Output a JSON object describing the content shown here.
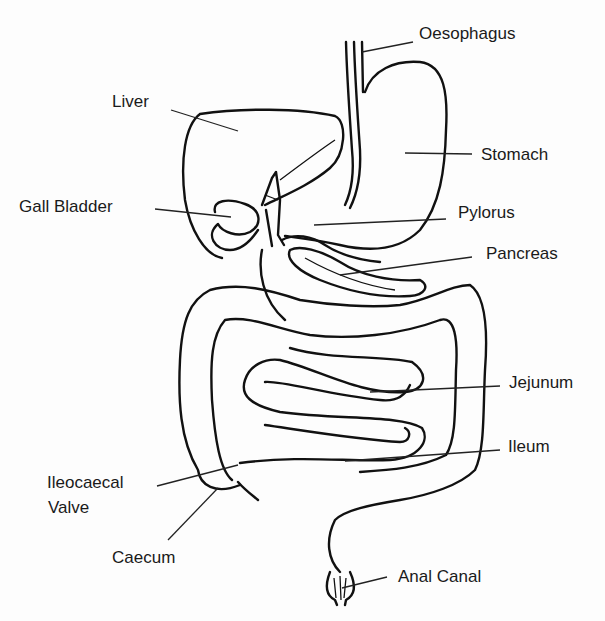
{
  "diagram": {
    "type": "anatomy",
    "labels": {
      "oesophagus": "Oesophagus",
      "liver": "Liver",
      "stomach": "Stomach",
      "gall_bladder": "Gall Bladder",
      "pylorus": "Pylorus",
      "pancreas": "Pancreas",
      "jejunum": "Jejunum",
      "ileum": "Ileum",
      "ileocaecal_valve_line1": "Ileocaecal",
      "ileocaecal_valve_line2": "Valve",
      "caecum": "Caecum",
      "anal_canal": "Anal Canal"
    },
    "colors": {
      "line": "#111111",
      "background": "#fdfdfd",
      "text": "#1a1a1a"
    }
  }
}
